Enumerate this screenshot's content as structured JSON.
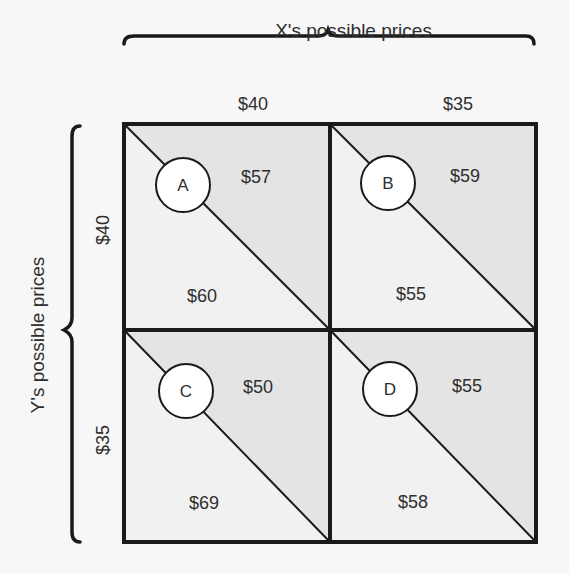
{
  "diagram": {
    "type": "payoff-matrix",
    "x_axis": {
      "title": "X's possible prices",
      "columns": [
        "$40",
        "$35"
      ]
    },
    "y_axis": {
      "title": "Y's possible prices",
      "rows": [
        "$40",
        "$35"
      ]
    },
    "cells": [
      {
        "id": "A",
        "x_price": "$40",
        "y_price": "$40",
        "upper_right_payoff": "$57",
        "lower_left_payoff": "$60"
      },
      {
        "id": "B",
        "x_price": "$35",
        "y_price": "$40",
        "upper_right_payoff": "$59",
        "lower_left_payoff": "$55"
      },
      {
        "id": "C",
        "x_price": "$40",
        "y_price": "$35",
        "upper_right_payoff": "$50",
        "lower_left_payoff": "$69"
      },
      {
        "id": "D",
        "x_price": "$35",
        "y_price": "$35",
        "upper_right_payoff": "$55",
        "lower_left_payoff": "$58"
      }
    ],
    "colors": {
      "background": "#f7f7f7",
      "upper_triangle": "#e4e4e4",
      "lower_triangle": "#f1f1f1",
      "lines": "#1a1a1a",
      "circle_fill": "#ffffff"
    }
  }
}
